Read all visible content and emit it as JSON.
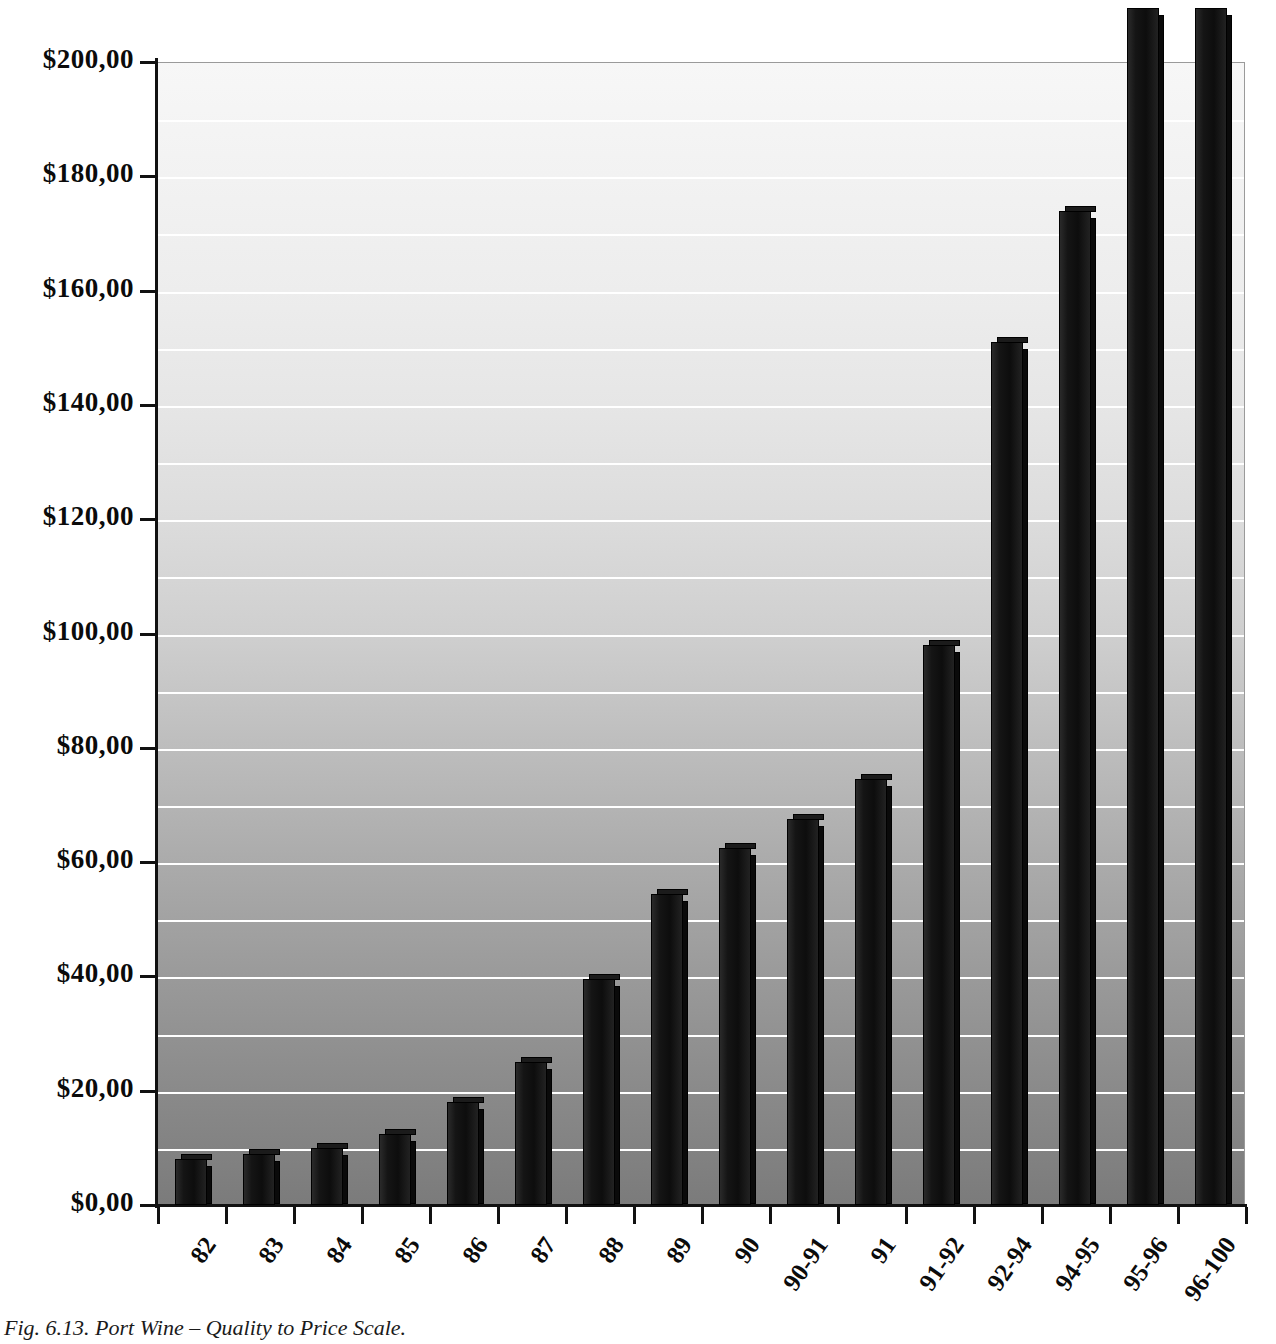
{
  "caption": "Fig. 6.13. Port Wine – Quality to Price Scale.",
  "chart_data": {
    "type": "bar",
    "title": "",
    "xlabel": "",
    "ylabel": "",
    "ylim": [
      0,
      200
    ],
    "ytick_step": 20,
    "grid": true,
    "grid_step": 10,
    "legend": "none",
    "currency_symbol": "$",
    "decimal_separator": ",",
    "ytick_labels": [
      "$0,00",
      "$20,00",
      "$40,00",
      "$60,00",
      "$80,00",
      "$100,00",
      "$120,00",
      "$140,00",
      "$160,00",
      "$180,00",
      "$200,00"
    ],
    "ytick_values": [
      0,
      20,
      40,
      60,
      80,
      100,
      120,
      140,
      160,
      180,
      200
    ],
    "categories": [
      "82",
      "83",
      "84",
      "85",
      "86",
      "87",
      "88",
      "89",
      "90",
      "90-91",
      "91",
      "91-92",
      "92-94",
      "94-95",
      "95-96",
      "96-100"
    ],
    "values": [
      8,
      9,
      10,
      12.5,
      18,
      25,
      39.5,
      54.5,
      62.5,
      67.5,
      74.5,
      98,
      151,
      174,
      220,
      220
    ],
    "clipped_above_axis": [
      "95-96",
      "96-100"
    ],
    "note": "Last two bars extend beyond the $200,00 axis maximum and are clipped at the top of the figure."
  },
  "colors": {
    "bar": "#111111",
    "gridline": "#ffffff",
    "axis": "#111111",
    "plot_background_top": "#f7f7f7",
    "plot_background_bottom": "#7b7b7b"
  }
}
